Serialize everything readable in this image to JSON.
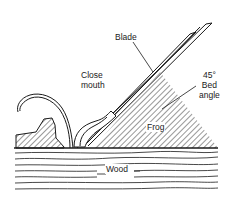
{
  "diagram": {
    "labels": {
      "blade": "Blade",
      "close_mouth_line1": "Close",
      "close_mouth_line2": "mouth",
      "bed_angle_line1": "45°",
      "bed_angle_line2": "Bed",
      "bed_angle_line3": "angle",
      "frog": "Frog",
      "wood": "Wood"
    },
    "components": [
      "blade",
      "chipbreaker",
      "frog",
      "sole-front",
      "shaving",
      "wood"
    ],
    "bed_angle_degrees": 45,
    "colors": {
      "line": "#1a1a1a",
      "background": "#ffffff"
    }
  }
}
